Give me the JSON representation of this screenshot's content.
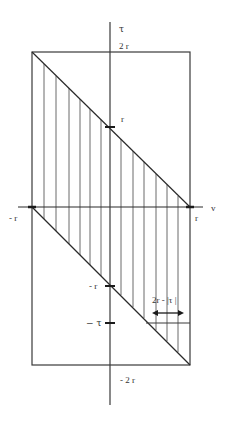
{
  "diagram": {
    "type": "integration-region",
    "colors": {
      "line": "#3a3a3a",
      "hatch": "#6a6a6a",
      "background": "#ffffff"
    },
    "axes": {
      "horizontal_label": "v",
      "vertical_label": "τ"
    },
    "tick_labels": {
      "two_r": "2 r",
      "r_vertical": "r",
      "minus_r_vertical": "- r",
      "minus_tau": "− τ",
      "minus_two_r": "- 2 r",
      "minus_r_horizontal": "- r",
      "r_horizontal": "r"
    },
    "annotation": {
      "width_label": "2r - |τ |"
    },
    "hatch_x_positions": [
      44,
      56,
      69,
      80,
      90,
      101,
      121,
      133,
      144,
      156,
      167,
      178
    ]
  }
}
